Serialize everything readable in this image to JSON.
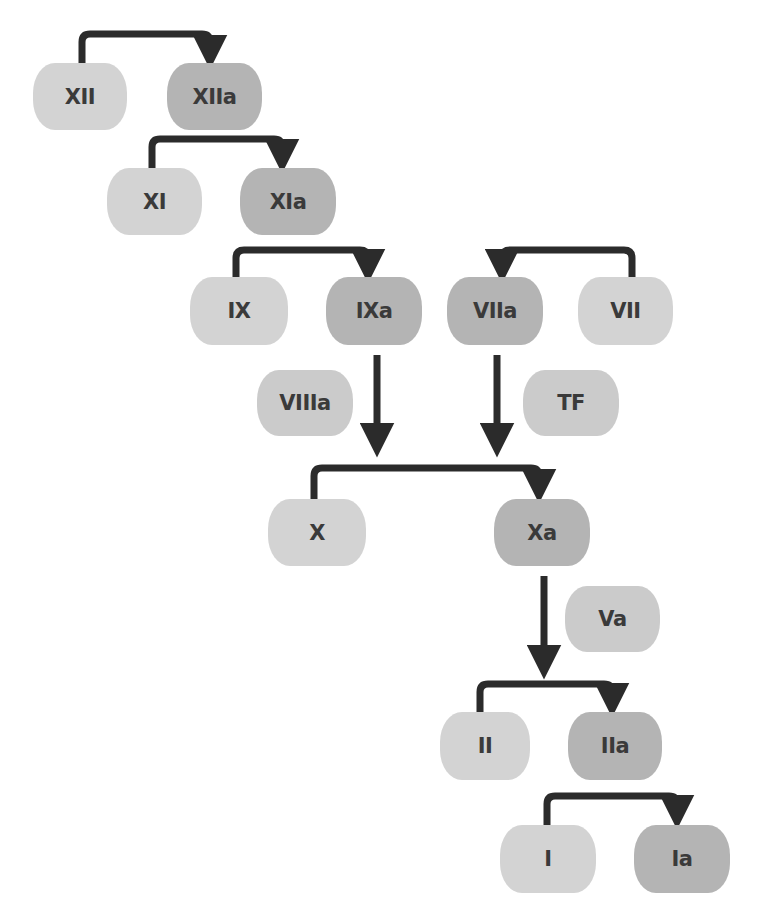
{
  "colors": {
    "zymogen_fill": "#d3d3d3",
    "active_fill": "#b4b4b4",
    "cofactor_fill": "#cbcbcb",
    "arrow": "#2b2b2b",
    "text": "#3a3a3a"
  },
  "nodes": {
    "xii": {
      "label": "XII"
    },
    "xiia": {
      "label": "XIIa"
    },
    "xi": {
      "label": "XI"
    },
    "xia": {
      "label": "XIa"
    },
    "ix": {
      "label": "IX"
    },
    "ixa": {
      "label": "IXa"
    },
    "viia": {
      "label": "VIIa"
    },
    "vii": {
      "label": "VII"
    },
    "viiia": {
      "label": "VIIIa"
    },
    "tf": {
      "label": "TF"
    },
    "x": {
      "label": "X"
    },
    "xa": {
      "label": "Xa"
    },
    "va": {
      "label": "Va"
    },
    "ii": {
      "label": "II"
    },
    "iia": {
      "label": "IIa"
    },
    "i": {
      "label": "I"
    },
    "ia": {
      "label": "Ia"
    }
  },
  "edges": [
    {
      "from": "XII",
      "to": "XIIa",
      "type": "activation"
    },
    {
      "from": "XI",
      "to": "XIa",
      "type": "activation"
    },
    {
      "from": "IX",
      "to": "IXa",
      "type": "activation"
    },
    {
      "from": "VII",
      "to": "VIIa",
      "type": "activation"
    },
    {
      "from": "IXa",
      "to": "X-activation",
      "type": "catalysis",
      "cofactor": "VIIIa"
    },
    {
      "from": "VIIa",
      "to": "X-activation",
      "type": "catalysis",
      "cofactor": "TF"
    },
    {
      "from": "X",
      "to": "Xa",
      "type": "activation"
    },
    {
      "from": "Xa",
      "to": "II-activation",
      "type": "catalysis",
      "cofactor": "Va"
    },
    {
      "from": "II",
      "to": "IIa",
      "type": "activation"
    },
    {
      "from": "I",
      "to": "Ia",
      "type": "activation"
    }
  ]
}
